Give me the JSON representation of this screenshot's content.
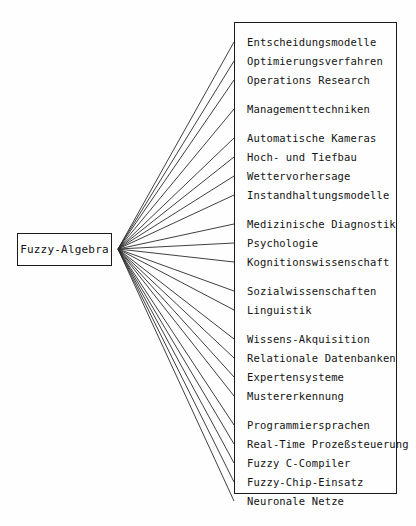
{
  "diagram": {
    "type": "fan-out-tree",
    "root": {
      "label": "Fuzzy-Algebra",
      "box": {
        "x": 17,
        "y": 233,
        "w": 95,
        "h": 33
      }
    },
    "fan_origin": {
      "x": 118,
      "y": 249
    },
    "applications_box": {
      "x": 234,
      "y": 22,
      "w": 163,
      "h": 472
    },
    "colors": {
      "ink": "#1b1b1b",
      "text": "#141414",
      "paper": "#fefefe",
      "edge": "#2a2a2a"
    },
    "row_pitch": 19,
    "group_gap": 10,
    "first_row_center": 42,
    "groups": [
      {
        "name": "operations-research-group",
        "items": [
          "Entscheidungsmodelle",
          "Optimierungsverfahren",
          "Operations Research"
        ]
      },
      {
        "name": "management-group",
        "items": [
          "Managementtechniken"
        ]
      },
      {
        "name": "engineering-group",
        "items": [
          "Automatische Kameras",
          "Hoch- und Tiefbau",
          "Wettervorhersage",
          "Instandhaltungsmodelle"
        ]
      },
      {
        "name": "medicine-psychology-group",
        "items": [
          "Medizinische Diagnostik",
          "Psychologie",
          "Kognitionswissenschaft"
        ]
      },
      {
        "name": "social-sciences-group",
        "items": [
          "Sozialwissenschaften",
          "Linguistik"
        ]
      },
      {
        "name": "knowledge-systems-group",
        "items": [
          "Wissens-Akquisition",
          "Relationale Datenbanken",
          "Expertensysteme",
          "Mustererkennung"
        ]
      },
      {
        "name": "computing-group",
        "items": [
          "Programmiersprachen",
          "Real-Time Prozeßsteuerung",
          "Fuzzy C-Compiler",
          "Fuzzy-Chip-Einsatz",
          "Neuronale Netze"
        ]
      }
    ]
  }
}
